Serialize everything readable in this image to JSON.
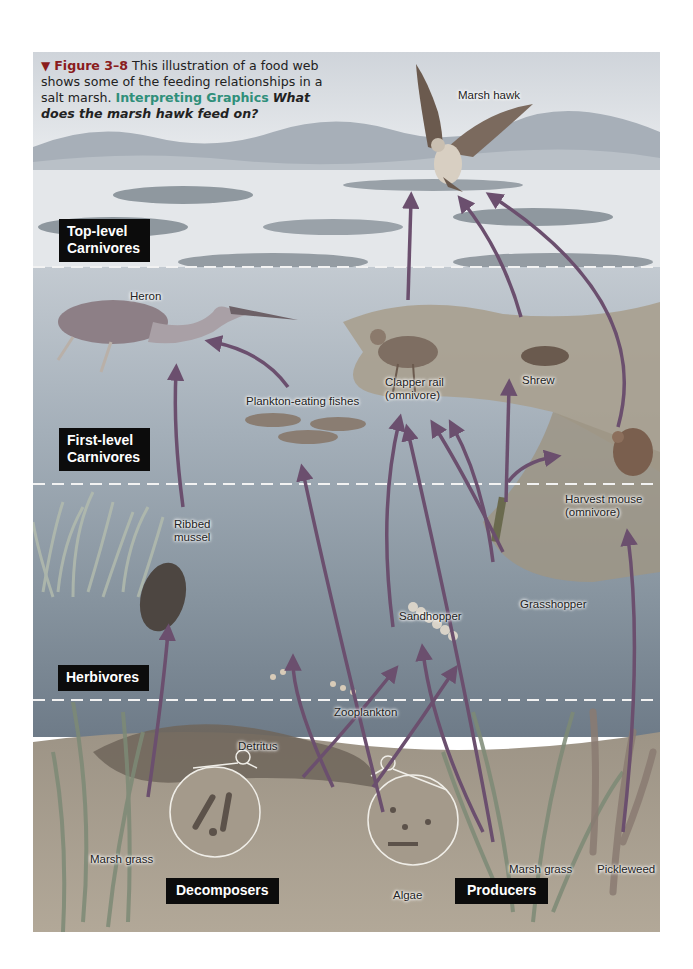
{
  "caption": {
    "marker": "▼",
    "figure_number": "Figure 3–8",
    "text": "This illustration of a food web shows some of the feeding relationships in a salt marsh.",
    "skill_label": "Interpreting Graphics",
    "question": "What does the marsh hawk feed on?"
  },
  "levels": [
    {
      "id": "top",
      "line1": "Top-level",
      "line2": "Carnivores"
    },
    {
      "id": "first",
      "line1": "First-level",
      "line2": "Carnivores"
    },
    {
      "id": "herb",
      "line1": "Herbivores",
      "line2": ""
    },
    {
      "id": "decomposers",
      "line1": "Decomposers",
      "line2": ""
    },
    {
      "id": "producers",
      "line1": "Producers",
      "line2": ""
    }
  ],
  "organisms": {
    "marsh_hawk": "Marsh hawk",
    "heron": "Heron",
    "plankton_fishes": "Plankton-eating fishes",
    "clapper_rail_1": "Clapper rail",
    "clapper_rail_2": "(omnivore)",
    "shrew": "Shrew",
    "harvest_mouse_1": "Harvest mouse",
    "harvest_mouse_2": "(omnivore)",
    "ribbed_mussel_1": "Ribbed",
    "ribbed_mussel_2": "mussel",
    "sandhopper": "Sandhopper",
    "grasshopper": "Grasshopper",
    "zooplankton": "Zooplankton",
    "detritus": "Detritus",
    "marsh_grass_left": "Marsh grass",
    "algae": "Algae",
    "marsh_grass_right": "Marsh grass",
    "pickleweed": "Pickleweed"
  },
  "colors": {
    "sky": "#d9dde2",
    "mountains": "#9aa3ad",
    "water_upper": "#b7c0c8",
    "water_mid": "#8c99a6",
    "water_low": "#6f7d8c",
    "sediment": "#a99d8c",
    "arrow": "#6b4f6e",
    "label_bg": "#0c0c0c",
    "divider": "#f2f2f2"
  }
}
